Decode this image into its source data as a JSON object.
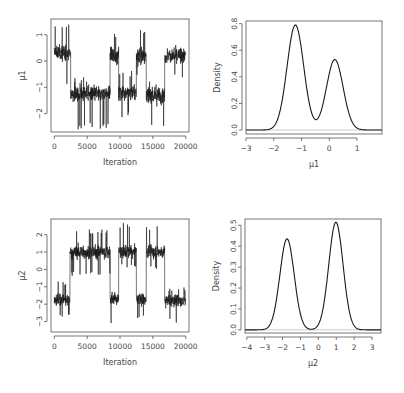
{
  "chart_data": [
    {
      "id": "trace_mu1",
      "type": "line",
      "title": "",
      "xlabel": "Iteration",
      "ylabel": "μ1",
      "xlim": [
        -500,
        20500
      ],
      "ylim": [
        -2.7,
        1.6
      ],
      "xticks": [
        0,
        5000,
        10000,
        15000,
        20000
      ],
      "xtick_labels": [
        "0",
        "5000",
        "10000",
        "15000",
        "20000"
      ],
      "yticks": [
        1,
        0,
        -1,
        -2
      ],
      "ytick_labels": [
        "1",
        "0",
        "−1",
        "−2"
      ],
      "grid": false,
      "segments": [
        {
          "start": 0,
          "end": 2500,
          "mean": 0.3,
          "spread": 0.45,
          "min": -0.9,
          "max": 1.4
        },
        {
          "start": 2500,
          "end": 8500,
          "mean": -1.25,
          "spread": 0.45,
          "min": -2.6,
          "max": -0.6
        },
        {
          "start": 8500,
          "end": 9800,
          "mean": 0.2,
          "spread": 0.45,
          "min": -0.4,
          "max": 1.2
        },
        {
          "start": 9800,
          "end": 12500,
          "mean": -1.2,
          "spread": 0.45,
          "min": -2.2,
          "max": -0.3
        },
        {
          "start": 12500,
          "end": 14000,
          "mean": 0.2,
          "spread": 0.45,
          "min": -0.7,
          "max": 1.2
        },
        {
          "start": 14000,
          "end": 16800,
          "mean": -1.3,
          "spread": 0.45,
          "min": -2.5,
          "max": -0.7
        },
        {
          "start": 16800,
          "end": 20000,
          "mean": 0.2,
          "spread": 0.45,
          "min": -0.7,
          "max": 1.3
        }
      ]
    },
    {
      "id": "density_mu1",
      "type": "line",
      "title": "",
      "xlabel": "μ1",
      "ylabel": "Density",
      "xlim": [
        -3,
        1.9
      ],
      "ylim": [
        -0.03,
        0.82
      ],
      "xticks": [
        -3,
        -2,
        -1,
        0,
        1
      ],
      "xtick_labels": [
        "−3",
        "−2",
        "−1",
        "0",
        "1"
      ],
      "yticks": [
        0.0,
        0.2,
        0.4,
        0.6,
        0.8
      ],
      "ytick_labels": [
        "0.0",
        "0.2",
        "0.4",
        "0.6",
        "0.8"
      ],
      "grid": false,
      "components": [
        {
          "mean": -1.22,
          "sd": 0.3,
          "peak": 0.79
        },
        {
          "mean": 0.2,
          "sd": 0.3,
          "peak": 0.53
        }
      ],
      "annotations": {
        "local_min": {
          "x": -0.55,
          "y": 0.07
        }
      }
    },
    {
      "id": "trace_mu2",
      "type": "line",
      "title": "",
      "xlabel": "Iteration",
      "ylabel": "μ2",
      "xlim": [
        -500,
        20500
      ],
      "ylim": [
        -3.6,
        2.9
      ],
      "xticks": [
        0,
        5000,
        10000,
        15000,
        20000
      ],
      "xtick_labels": [
        "0",
        "5000",
        "10000",
        "15000",
        "20000"
      ],
      "yticks": [
        2,
        1,
        0,
        -1,
        -2,
        -3
      ],
      "ytick_labels": [
        "2",
        "1",
        "0",
        "−1",
        "−2",
        "−3"
      ],
      "grid": false,
      "segments": [
        {
          "start": 0,
          "end": 2400,
          "mean": -1.75,
          "spread": 0.55,
          "min": -2.8,
          "max": -0.7
        },
        {
          "start": 2400,
          "end": 8500,
          "mean": 1.0,
          "spread": 0.55,
          "min": -0.4,
          "max": 2.3
        },
        {
          "start": 8500,
          "end": 9800,
          "mean": -1.7,
          "spread": 0.55,
          "min": -3.3,
          "max": -0.9
        },
        {
          "start": 9800,
          "end": 12500,
          "mean": 1.0,
          "spread": 0.55,
          "min": 0.0,
          "max": 2.7
        },
        {
          "start": 12500,
          "end": 14000,
          "mean": -1.7,
          "spread": 0.55,
          "min": -2.8,
          "max": 0.3
        },
        {
          "start": 14000,
          "end": 16800,
          "mean": 1.0,
          "spread": 0.55,
          "min": 0.0,
          "max": 2.5
        },
        {
          "start": 16800,
          "end": 20000,
          "mean": -1.8,
          "spread": 0.55,
          "min": -3.1,
          "max": -1.0
        }
      ]
    },
    {
      "id": "density_mu2",
      "type": "line",
      "title": "",
      "xlabel": "μ2",
      "ylabel": "Density",
      "xlim": [
        -4.1,
        3.5
      ],
      "ylim": [
        -0.015,
        0.53
      ],
      "xticks": [
        -4,
        -3,
        -2,
        -1,
        0,
        1,
        2,
        3
      ],
      "xtick_labels": [
        "−4",
        "−3",
        "−2",
        "−1",
        "0",
        "1",
        "2",
        "3"
      ],
      "yticks": [
        0.0,
        0.1,
        0.2,
        0.3,
        0.4,
        0.5
      ],
      "ytick_labels": [
        "0.0",
        "0.1",
        "0.2",
        "0.3",
        "0.4",
        "0.5"
      ],
      "grid": false,
      "components": [
        {
          "mean": -1.75,
          "sd": 0.4,
          "peak": 0.435
        },
        {
          "mean": 0.98,
          "sd": 0.4,
          "peak": 0.515
        }
      ],
      "annotations": {
        "local_min": {
          "x": -0.45,
          "y": 0.005
        }
      }
    }
  ],
  "panels": [
    {
      "frame": {
        "x": 51,
        "y": 19,
        "w": 138,
        "h": 113
      }
    },
    {
      "frame": {
        "x": 246,
        "y": 21,
        "w": 136,
        "h": 113
      }
    },
    {
      "frame": {
        "x": 51,
        "y": 219,
        "w": 138,
        "h": 113
      }
    },
    {
      "frame": {
        "x": 245,
        "y": 219,
        "w": 136,
        "h": 114
      }
    }
  ],
  "colors": {
    "line": "#1a1a1a",
    "axis": "#555555",
    "baseline": "#bbbbbb",
    "text": "#444444"
  }
}
